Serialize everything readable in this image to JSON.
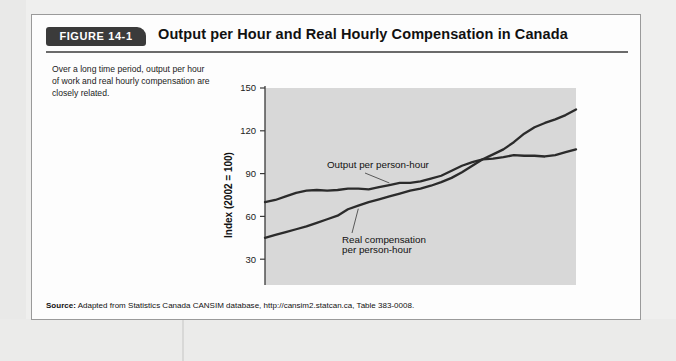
{
  "figure": {
    "badge": "FIGURE 14-1",
    "title": "Output per Hour and Real Hourly Compensation in Canada",
    "caption": "Over a long time period, output per hour of work and real hourly compensation are closely related.",
    "source_label": "Source:",
    "source_text": " Adapted from Statistics Canada CANSIM database, http://cansim2.statcan.ca, Table 383-0008."
  },
  "colors": {
    "plot_background": "#d8d8d8",
    "line": "#2b2b2b",
    "axis": "#3a3a3a",
    "badge_background": "#3b3b3b",
    "box_border": "#9a9a9a",
    "page_background": "#efefee"
  },
  "chart_data": {
    "type": "line",
    "title": "Output per Hour and Real Hourly Compensation in Canada",
    "xlabel": "",
    "ylabel": "Index (2002 = 100)",
    "xlim": [
      1981,
      2011
    ],
    "ylim": [
      0,
      150
    ],
    "yticks": [
      30,
      60,
      90,
      120,
      150
    ],
    "xticks": [
      1981,
      1985,
      1990,
      1995,
      2000,
      2005,
      2010
    ],
    "origin_label": "0",
    "grid": false,
    "legend": "inline-annotations",
    "x": [
      1981,
      1982,
      1983,
      1984,
      1985,
      1986,
      1987,
      1988,
      1989,
      1990,
      1991,
      1992,
      1993,
      1994,
      1995,
      1996,
      1997,
      1998,
      1999,
      2000,
      2001,
      2002,
      2003,
      2004,
      2005,
      2006,
      2007,
      2008,
      2009,
      2010,
      2011
    ],
    "series": [
      {
        "name": "Output per person-hour",
        "values": [
          70,
          71.5,
          74,
          76.5,
          78,
          78.5,
          78,
          78.5,
          79.5,
          79.5,
          79,
          80.5,
          82,
          83.5,
          83.5,
          84.5,
          86.5,
          88.5,
          92,
          95.5,
          98,
          100,
          100.5,
          101.5,
          103,
          102.5,
          102.5,
          102,
          103,
          105,
          107
        ]
      },
      {
        "name": "Real compensation per person-hour",
        "values": [
          45,
          47,
          49,
          51,
          53,
          55.5,
          58,
          60.5,
          65,
          67.5,
          70,
          72,
          74,
          76,
          78,
          79.5,
          81.5,
          84,
          87,
          91,
          95.5,
          100,
          103.5,
          107,
          112,
          118,
          122.5,
          125.5,
          128,
          131,
          135
        ]
      }
    ],
    "annotations": [
      {
        "text": "Output per person-hour",
        "target_year": 1993,
        "target_value": 82
      },
      {
        "text_line1": "Real compensation",
        "text_line2": "per person-hour",
        "target_year": 1990,
        "target_value": 67.5
      }
    ]
  }
}
